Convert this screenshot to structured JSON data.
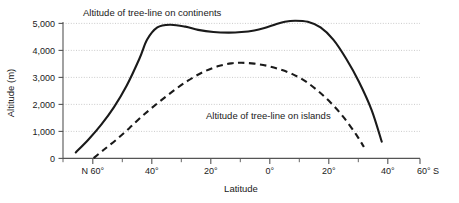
{
  "chart_data": {
    "type": "line",
    "title": "",
    "xlabel": "Latitude",
    "ylabel": "Altitude (m)",
    "grid": true,
    "legend_position": "inline-annotations",
    "ylim": [
      0,
      5000
    ],
    "yticks": [
      0,
      1000,
      2000,
      3000,
      4000,
      5000
    ],
    "ytick_labels": [
      "0",
      "1,000",
      "2,000",
      "3,000",
      "4,000",
      "5,000"
    ],
    "xlim": [
      70,
      -70
    ],
    "xticks": [
      60,
      40,
      20,
      0,
      -20,
      -40,
      -60
    ],
    "xtick_labels": [
      "N 60°",
      "40°",
      "20°",
      "0°",
      "20°",
      "40°",
      "60° S"
    ],
    "xtick_minor": [
      50,
      30,
      10,
      -10,
      -30,
      -50
    ],
    "series": [
      {
        "name": "Altitude of tree-line on continents",
        "style": "solid",
        "color": "#1a1a1a",
        "x": [
          65,
          60,
          55,
          50,
          45,
          40,
          37,
          33,
          28,
          22,
          17,
          11,
          5,
          0,
          -5,
          -9,
          -13,
          -17,
          -21,
          -26,
          -31,
          -36,
          -41,
          -46,
          -51,
          -55
        ],
        "y": [
          220,
          700,
          1250,
          1900,
          2700,
          3700,
          4400,
          4850,
          4950,
          4880,
          4760,
          4680,
          4660,
          4680,
          4740,
          4830,
          4950,
          5060,
          5100,
          5060,
          4850,
          4400,
          3700,
          2850,
          1800,
          620
        ]
      },
      {
        "name": "Altitude of tree-line on islands",
        "style": "dashed",
        "color": "#1a1a1a",
        "x": [
          58,
          54,
          49,
          44,
          39,
          33,
          27,
          21,
          15,
          9,
          4,
          0,
          -5,
          -10,
          -15,
          -20,
          -25,
          -30,
          -35,
          -40,
          -45,
          -48
        ],
        "y": [
          10,
          320,
          700,
          1120,
          1560,
          2040,
          2480,
          2880,
          3200,
          3420,
          3520,
          3540,
          3510,
          3430,
          3300,
          3120,
          2860,
          2500,
          2060,
          1530,
          880,
          420
        ]
      }
    ],
    "annotations": [
      {
        "text": "Altitude of tree-line on continents",
        "x_px": 83,
        "y_px": 16
      },
      {
        "text": "Altitude of tree-line on islands",
        "x_px": 206,
        "y_px": 119
      }
    ]
  }
}
